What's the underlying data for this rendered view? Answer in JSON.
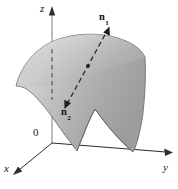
{
  "figure": {
    "kind": "3d-surface-normal-vectors-diagram",
    "width": 178,
    "height": 189,
    "background_color": "#ffffff"
  },
  "axes": {
    "z": {
      "label": "z",
      "name": "z-axis",
      "arrow": "up",
      "color": "#8c8c8c",
      "hidden_segment_style": "dashed"
    },
    "y": {
      "label": "y",
      "name": "y-axis",
      "arrow": "right",
      "color": "#2b2b2b"
    },
    "x": {
      "label": "x",
      "name": "x-axis",
      "arrow": "down-left",
      "color": "#2b2b2b"
    },
    "origin": {
      "label": "0",
      "name": "origin"
    }
  },
  "surface": {
    "name": "oriented-surface",
    "fill_light": "#d8d8d8",
    "fill_mid": "#b4b4b4",
    "fill_dark": "#9a9a9a",
    "outline_color": "#6f6f6f"
  },
  "normals": {
    "line_style": "dashed",
    "line_color": "#1d1d1d",
    "point_color": "#1d1d1d",
    "upper": {
      "label": "n",
      "subscript": "1",
      "name": "normal-vector-n1",
      "direction": "up-right"
    },
    "lower": {
      "label": "n",
      "subscript": "2",
      "name": "normal-vector-n2",
      "direction": "down-left"
    }
  }
}
